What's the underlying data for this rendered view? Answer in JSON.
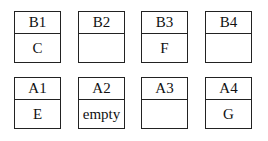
{
  "rows": [
    {
      "cells": [
        {
          "label": "B1",
          "content": "C"
        },
        {
          "label": "B2",
          "content": ""
        },
        {
          "label": "B3",
          "content": "F"
        },
        {
          "label": "B4",
          "content": ""
        }
      ]
    },
    {
      "cells": [
        {
          "label": "A1",
          "content": "E"
        },
        {
          "label": "A2",
          "content": "empty"
        },
        {
          "label": "A3",
          "content": ""
        },
        {
          "label": "A4",
          "content": "G"
        }
      ]
    }
  ]
}
